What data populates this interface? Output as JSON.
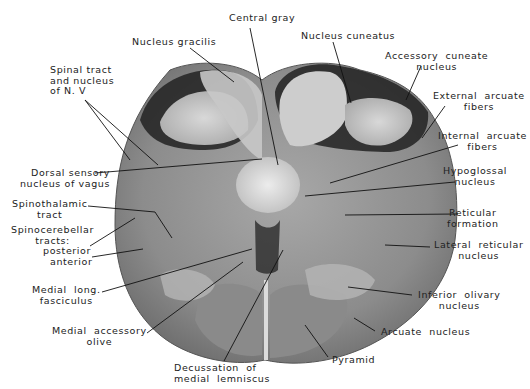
{
  "figure": {
    "labels": {
      "central_gray": "Central gray",
      "nucleus_gracilis": "Nucleus gracilis",
      "nucleus_cuneatus": "Nucleus cuneatus",
      "spinal_tract_n5": "Spinal tract\nand nucleus\nof N. V",
      "accessory_cuneate": "Accessory  cuneate\nnucleus",
      "external_arcuate": "External  arcuate\nfibers",
      "internal_arcuate": "Internal  arcuate\nfibers",
      "dorsal_sensory_vagus": "Dorsal sensory\nnucleus of vagus",
      "hypoglossal": "Hypoglossal\nnucleus",
      "spinothalamic": "Spinothalamic\ntract",
      "reticular_formation": "Reticular\nformation",
      "spinocerebellar": "Spinocerebellar\ntracts:",
      "posterior": "posterior",
      "anterior": "anterior",
      "lateral_reticular": "Lateral  reticular\nnucleus",
      "medial_long_fasciculus": "Medial  long.\nfasciculus",
      "inferior_olivary": "Inferior  olivary\nnucleus",
      "medial_accessory_olive": "Medial  accessory\nolive",
      "arcuate_nucleus": "Arcuate  nucleus",
      "decussation": "Decussation  of\nmedial  lemniscus",
      "pyramid": "Pyramid"
    },
    "colors": {
      "background": "#ffffff",
      "tissue_light": "#c9c9c9",
      "tissue_mid": "#9a9a9a",
      "tissue_dark": "#3a3a3a",
      "leader_line": "#111111",
      "text": "#222222"
    }
  }
}
